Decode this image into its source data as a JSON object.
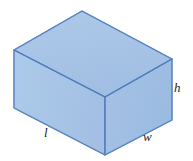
{
  "figure": {
    "shape_name": "rectangular-prism",
    "background_color": "#ffffff"
  },
  "colors": {
    "face_top": "#a6c3e6",
    "face_left": "#a9c5e7",
    "face_right": "#a4c1e4",
    "edge_stroke": "#5b87c2",
    "edge_stroke_dark": "#3f6fae",
    "label_text": "#1b1b1b"
  },
  "geometry": {
    "vertices": {
      "top_back": [
        82,
        11
      ],
      "top_left": [
        14,
        50
      ],
      "top_right": [
        172,
        59
      ],
      "top_front": [
        105,
        97
      ],
      "bottom_left": [
        14,
        108
      ],
      "bottom_front": [
        105,
        155
      ],
      "bottom_right": [
        172,
        120
      ]
    },
    "faces": {
      "top": "82,11 172,59 105,97 14,50",
      "left": "14,50 105,97 105,155 14,108",
      "right": "105,97 172,59 172,120 105,155"
    }
  },
  "labels": {
    "length": {
      "text": "l",
      "meaning": "length",
      "x": 44,
      "y": 126
    },
    "width": {
      "text": "w",
      "meaning": "width",
      "x": 143,
      "y": 130
    },
    "height": {
      "text": "h",
      "meaning": "height",
      "x": 174,
      "y": 81
    }
  }
}
